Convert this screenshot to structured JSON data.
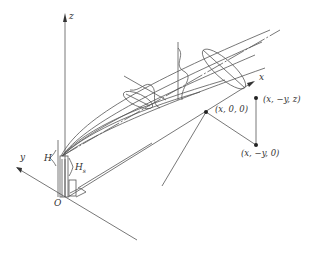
{
  "diagram": {
    "colors": {
      "line": "#555555",
      "ink": "#333333",
      "background": "#ffffff"
    },
    "axes": {
      "z_label": "z",
      "x_label": "x",
      "y_label": "y",
      "origin_label": "O"
    },
    "stack": {
      "effective_height_label": "H",
      "physical_height_label": "H",
      "physical_height_subscript": "s"
    },
    "points": [
      {
        "label": "(x, 0, 0)"
      },
      {
        "label": "(x, −y, z)"
      },
      {
        "label": "(x, −y, 0)"
      }
    ]
  }
}
